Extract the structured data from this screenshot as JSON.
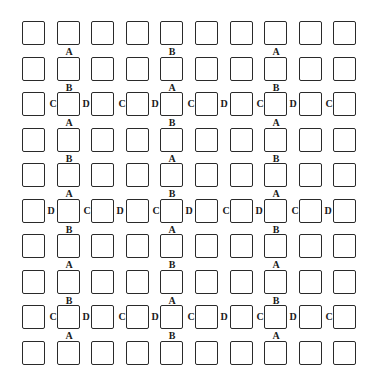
{
  "diagram": {
    "rows": 10,
    "cols": 10,
    "grid_origin": {
      "x": 22,
      "y": 21
    },
    "pitch": {
      "x": 34.6,
      "y": 35.5
    },
    "box_size": {
      "w": 23,
      "h": 24
    },
    "line_color": "#2a2a2a",
    "vertical_labels": [
      {
        "between_rows": [
          0,
          1
        ],
        "col": 1,
        "text": "A"
      },
      {
        "between_rows": [
          0,
          1
        ],
        "col": 4,
        "text": "B"
      },
      {
        "between_rows": [
          0,
          1
        ],
        "col": 7,
        "text": "A"
      },
      {
        "between_rows": [
          1,
          2
        ],
        "col": 1,
        "text": "B"
      },
      {
        "between_rows": [
          1,
          2
        ],
        "col": 4,
        "text": "A"
      },
      {
        "between_rows": [
          1,
          2
        ],
        "col": 7,
        "text": "B"
      },
      {
        "between_rows": [
          2,
          3
        ],
        "col": 1,
        "text": "A"
      },
      {
        "between_rows": [
          2,
          3
        ],
        "col": 4,
        "text": "B"
      },
      {
        "between_rows": [
          2,
          3
        ],
        "col": 7,
        "text": "A"
      },
      {
        "between_rows": [
          3,
          4
        ],
        "col": 1,
        "text": "B"
      },
      {
        "between_rows": [
          3,
          4
        ],
        "col": 4,
        "text": "A"
      },
      {
        "between_rows": [
          3,
          4
        ],
        "col": 7,
        "text": "B"
      },
      {
        "between_rows": [
          4,
          5
        ],
        "col": 1,
        "text": "A"
      },
      {
        "between_rows": [
          4,
          5
        ],
        "col": 4,
        "text": "B"
      },
      {
        "between_rows": [
          4,
          5
        ],
        "col": 7,
        "text": "A"
      },
      {
        "between_rows": [
          5,
          6
        ],
        "col": 1,
        "text": "B"
      },
      {
        "between_rows": [
          5,
          6
        ],
        "col": 4,
        "text": "A"
      },
      {
        "between_rows": [
          5,
          6
        ],
        "col": 7,
        "text": "B"
      },
      {
        "between_rows": [
          6,
          7
        ],
        "col": 1,
        "text": "A"
      },
      {
        "between_rows": [
          6,
          7
        ],
        "col": 4,
        "text": "B"
      },
      {
        "between_rows": [
          6,
          7
        ],
        "col": 7,
        "text": "A"
      },
      {
        "between_rows": [
          7,
          8
        ],
        "col": 1,
        "text": "B"
      },
      {
        "between_rows": [
          7,
          8
        ],
        "col": 4,
        "text": "A"
      },
      {
        "between_rows": [
          7,
          8
        ],
        "col": 7,
        "text": "B"
      },
      {
        "between_rows": [
          8,
          9
        ],
        "col": 1,
        "text": "A"
      },
      {
        "between_rows": [
          8,
          9
        ],
        "col": 4,
        "text": "B"
      },
      {
        "between_rows": [
          8,
          9
        ],
        "col": 7,
        "text": "A"
      }
    ],
    "horizontal_labels": [
      {
        "row": 2,
        "texts": [
          "C",
          "D",
          "C",
          "D",
          "C",
          "D",
          "C",
          "D",
          "C"
        ]
      },
      {
        "row": 5,
        "texts": [
          "D",
          "C",
          "D",
          "C",
          "D",
          "C",
          "D",
          "C",
          "D"
        ]
      },
      {
        "row": 8,
        "texts": [
          "C",
          "D",
          "C",
          "D",
          "C",
          "D",
          "C",
          "D",
          "C"
        ]
      }
    ]
  }
}
